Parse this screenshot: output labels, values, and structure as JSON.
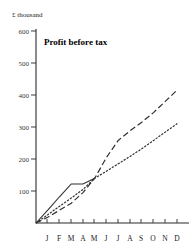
{
  "chart_data": {
    "type": "line",
    "title": "Profit before tax",
    "ylabel": "£ thousand",
    "xlabel": "",
    "categories": [
      "J",
      "F",
      "M",
      "A",
      "M",
      "J",
      "J",
      "A",
      "S",
      "O",
      "N",
      "D"
    ],
    "ytick_labels": [
      "600",
      "500",
      "400",
      "300",
      "200",
      "100"
    ],
    "ytick_values": [
      600,
      500,
      400,
      300,
      200,
      100
    ],
    "ylim": [
      0,
      600
    ],
    "grid": false,
    "legend": "none",
    "series": [
      {
        "name": "actual",
        "style": "solid",
        "x": [
          "0",
          "J",
          "F",
          "M",
          "A",
          "M"
        ],
        "values": [
          0,
          40,
          82,
          122,
          122,
          140
        ]
      },
      {
        "name": "upper-projection",
        "style": "dashed",
        "x": [
          "0",
          "J",
          "F",
          "M",
          "A",
          "M",
          "J",
          "J",
          "A",
          "S",
          "O",
          "N",
          "D"
        ],
        "values": [
          0,
          18,
          40,
          62,
          95,
          140,
          205,
          258,
          288,
          315,
          345,
          380,
          415
        ]
      },
      {
        "name": "lower-projection",
        "style": "dotted",
        "x": [
          "0",
          "J",
          "F",
          "M",
          "A",
          "M",
          "J",
          "J",
          "A",
          "S",
          "O",
          "N",
          "D"
        ],
        "values": [
          0,
          26,
          52,
          78,
          105,
          140,
          162,
          185,
          208,
          232,
          258,
          284,
          310
        ]
      }
    ],
    "colors": {
      "axis": "#2b2b2b",
      "series": "#2f2f2f",
      "title": "#000000",
      "background": "#ffffff"
    }
  }
}
